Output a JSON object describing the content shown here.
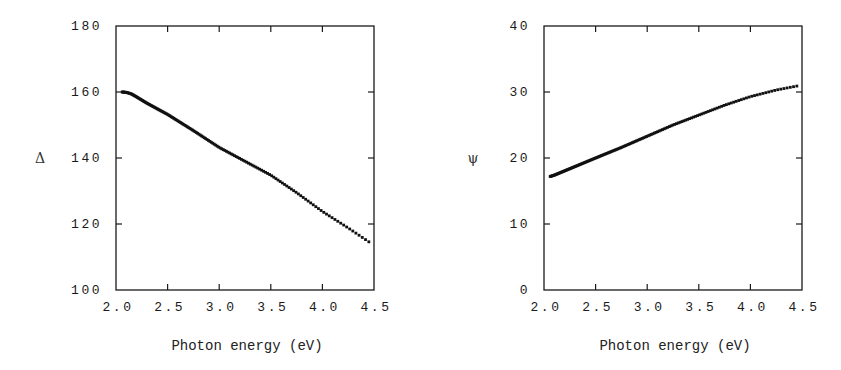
{
  "chart_data": [
    {
      "type": "scatter",
      "title": "",
      "xlabel": "Photon energy (eV)",
      "ylabel": "Δ",
      "xlim": [
        2.0,
        4.5
      ],
      "ylim": [
        100,
        180
      ],
      "xticks": [
        "2.0",
        "2.5",
        "3.0",
        "3.5",
        "4.0",
        "4.5"
      ],
      "yticks": [
        "100",
        "120",
        "140",
        "160",
        "180"
      ],
      "grid": false,
      "legend": "none",
      "series": [
        {
          "name": "Delta",
          "x": [
            2.06,
            2.1,
            2.15,
            2.2,
            2.3,
            2.5,
            2.75,
            3.0,
            3.25,
            3.5,
            3.75,
            4.0,
            4.25,
            4.45
          ],
          "y": [
            160.0,
            159.9,
            159.4,
            158.5,
            156.6,
            153.2,
            148.3,
            143.2,
            139.0,
            134.8,
            129.5,
            123.8,
            118.8,
            114.6
          ]
        }
      ]
    },
    {
      "type": "scatter",
      "title": "",
      "xlabel": "Photon energy (eV)",
      "ylabel": "ψ",
      "xlim": [
        2.0,
        4.5
      ],
      "ylim": [
        0,
        40
      ],
      "xticks": [
        "2.0",
        "2.5",
        "3.0",
        "3.5",
        "4.0",
        "4.5"
      ],
      "yticks": [
        "0",
        "10",
        "20",
        "30",
        "40"
      ],
      "grid": false,
      "legend": "none",
      "series": [
        {
          "name": "Psi",
          "x": [
            2.06,
            2.1,
            2.3,
            2.5,
            2.75,
            3.0,
            3.25,
            3.5,
            3.75,
            4.0,
            4.25,
            4.45
          ],
          "y": [
            17.2,
            17.4,
            18.7,
            20.0,
            21.6,
            23.3,
            25.0,
            26.5,
            28.0,
            29.3,
            30.3,
            30.9
          ]
        }
      ]
    }
  ]
}
